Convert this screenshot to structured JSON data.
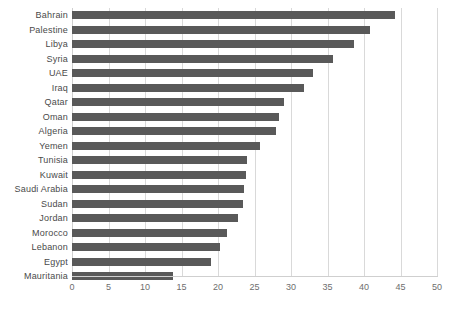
{
  "chart_data": {
    "type": "bar",
    "orientation": "horizontal",
    "title": "",
    "subtitle": "",
    "xlabel": "",
    "ylabel": "",
    "xlim": [
      0,
      50
    ],
    "xticks": [
      0,
      5,
      10,
      15,
      20,
      25,
      30,
      35,
      40,
      45,
      50
    ],
    "grid": "vertical",
    "legend": "none",
    "bar_color": "#595959",
    "gridline_color": "#d9d9d9",
    "label_color": "#4a4a4a",
    "tick_color": "#6e6e6e",
    "categories": [
      "Bahrain",
      "Palestine",
      "Libya",
      "Syria",
      "UAE",
      "Iraq",
      "Qatar",
      "Oman",
      "Algeria",
      "Yemen",
      "Tunisia",
      "Kuwait",
      "Saudi Arabia",
      "Sudan",
      "Jordan",
      "Morocco",
      "Lebanon",
      "Egypt",
      "Mauritania"
    ],
    "values": [
      44.3,
      40.8,
      38.6,
      35.7,
      33.0,
      31.8,
      29.0,
      28.4,
      28.0,
      25.8,
      24.0,
      23.8,
      23.5,
      23.4,
      22.7,
      21.2,
      20.3,
      19.0,
      13.8
    ]
  }
}
